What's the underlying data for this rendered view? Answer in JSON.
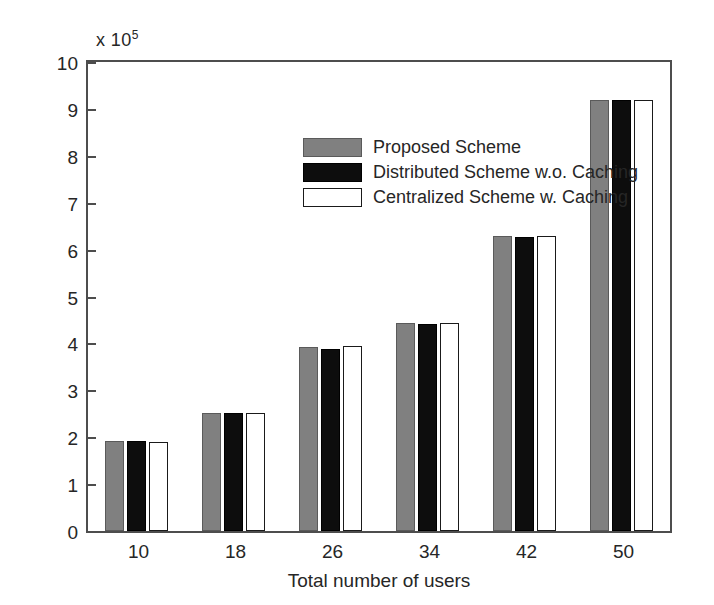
{
  "figure": {
    "y_multiplier_prefix": "x 10",
    "y_multiplier_exponent": "5"
  },
  "chart_data": {
    "type": "bar",
    "title": "",
    "xlabel": "Total number of users",
    "ylabel": "Computing revenue of MVNO",
    "y_multiplier": "x 10^5",
    "categories": [
      "10",
      "18",
      "26",
      "34",
      "42",
      "50"
    ],
    "series": [
      {
        "name": "Proposed Scheme",
        "color": "#808080",
        "values": [
          1.92,
          2.52,
          3.92,
          4.43,
          6.28,
          9.2
        ]
      },
      {
        "name": "Distributed Scheme w.o. Caching",
        "color": "#0d0d0d",
        "values": [
          1.91,
          2.51,
          3.88,
          4.41,
          6.27,
          9.19
        ]
      },
      {
        "name": "Centralized Scheme w. Caching",
        "color": "#ffffff",
        "values": [
          1.9,
          2.51,
          3.94,
          4.44,
          6.28,
          9.19
        ]
      }
    ],
    "ylim": [
      0,
      10
    ],
    "yticks": [
      "0",
      "1",
      "2",
      "3",
      "4",
      "5",
      "6",
      "7",
      "8",
      "9",
      "10"
    ],
    "xticks": [
      "10",
      "18",
      "26",
      "34",
      "42",
      "50"
    ],
    "grid": false,
    "legend_position": "upper center"
  },
  "legend": {
    "entries": [
      {
        "label": "Proposed Scheme",
        "swatch": "gray-filled-rect"
      },
      {
        "label": "Distributed Scheme w.o. Caching",
        "swatch": "black-filled-rect"
      },
      {
        "label": "Centralized Scheme w. Caching",
        "swatch": "white-filled-rect"
      }
    ]
  }
}
